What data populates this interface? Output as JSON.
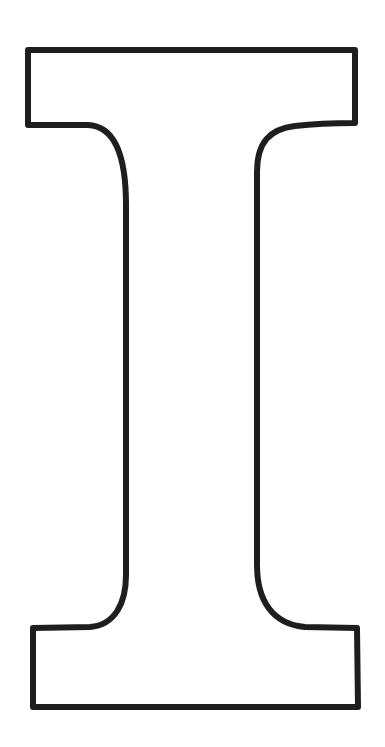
{
  "figure": {
    "letter": "I",
    "style": "outline",
    "fill_color": "#ffffff",
    "stroke_color": "#1e1e1e",
    "stroke_width": 6,
    "background_color": "#ffffff"
  }
}
